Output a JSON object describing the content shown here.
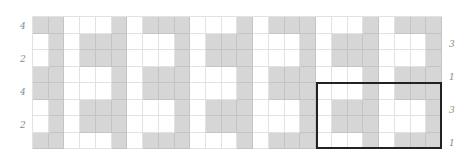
{
  "diagram": {
    "columns": 26,
    "rows": 8,
    "colors": {
      "filled": "#d6d6d6",
      "empty": "#ffffff",
      "gridline": "#e2e2e2",
      "label": "#8a8a8a",
      "highlight_border": "#222222"
    },
    "grid": [
      [
        1,
        1,
        0,
        0,
        0,
        1,
        0,
        1,
        1,
        1,
        0,
        0,
        0,
        1,
        0,
        1,
        1,
        1,
        0,
        0,
        0,
        1,
        0,
        1,
        1,
        1
      ],
      [
        0,
        1,
        0,
        1,
        1,
        1,
        0,
        0,
        0,
        1,
        0,
        1,
        1,
        1,
        0,
        0,
        0,
        1,
        0,
        1,
        1,
        1,
        0,
        0,
        0,
        1
      ],
      [
        0,
        1,
        0,
        1,
        1,
        1,
        0,
        0,
        0,
        1,
        0,
        1,
        1,
        1,
        0,
        0,
        0,
        1,
        0,
        1,
        1,
        1,
        0,
        0,
        0,
        1
      ],
      [
        1,
        1,
        0,
        0,
        0,
        1,
        0,
        1,
        1,
        1,
        0,
        0,
        0,
        1,
        0,
        1,
        1,
        1,
        0,
        0,
        0,
        1,
        0,
        1,
        1,
        1
      ],
      [
        1,
        1,
        0,
        0,
        0,
        1,
        0,
        1,
        1,
        1,
        0,
        0,
        0,
        1,
        0,
        1,
        1,
        1,
        0,
        0,
        0,
        1,
        0,
        1,
        1,
        1
      ],
      [
        0,
        1,
        0,
        1,
        1,
        1,
        0,
        0,
        0,
        1,
        0,
        1,
        1,
        1,
        0,
        0,
        0,
        1,
        0,
        1,
        1,
        1,
        0,
        0,
        0,
        1
      ],
      [
        0,
        1,
        0,
        1,
        1,
        1,
        0,
        0,
        0,
        1,
        0,
        1,
        1,
        1,
        0,
        0,
        0,
        1,
        0,
        1,
        1,
        1,
        0,
        0,
        0,
        1
      ],
      [
        1,
        1,
        0,
        0,
        0,
        1,
        0,
        1,
        1,
        1,
        0,
        0,
        0,
        1,
        0,
        1,
        1,
        1,
        0,
        0,
        0,
        1,
        0,
        1,
        1,
        1
      ]
    ],
    "left_labels": [
      {
        "text": "4",
        "row": 1
      },
      {
        "text": "2",
        "row": 3
      },
      {
        "text": "4",
        "row": 5
      },
      {
        "text": "2",
        "row": 7
      }
    ],
    "right_labels": [
      {
        "text": "3",
        "row": 2
      },
      {
        "text": "1",
        "row": 4
      },
      {
        "text": "3",
        "row": 6
      },
      {
        "text": "1",
        "row": 8
      }
    ],
    "highlight": {
      "col_start": 19,
      "col_end": 26,
      "row_start": 5,
      "row_end": 8
    }
  }
}
